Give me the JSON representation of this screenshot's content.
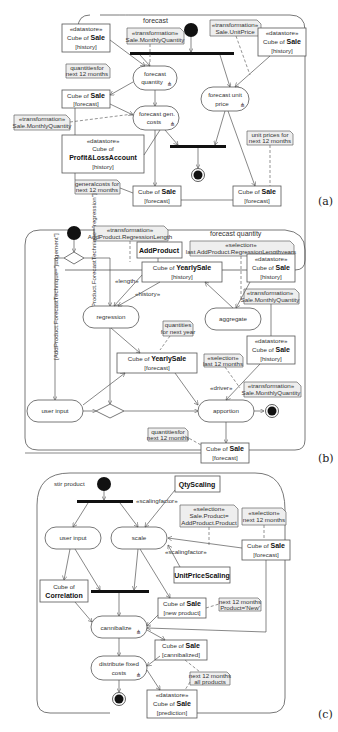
{
  "panels": [
    {
      "label": "(a)",
      "title": "forecast",
      "actions": [
        {
          "id": "forecast-quantity",
          "lines": [
            "forecast",
            "quantity"
          ],
          "rake": true
        },
        {
          "id": "forecast-unit-price",
          "lines": [
            "forecast unit",
            "price"
          ],
          "rake": true
        },
        {
          "id": "forecast-gen-costs",
          "lines": [
            "forecast gen.",
            "costs"
          ],
          "rake": true
        }
      ],
      "objects": [
        {
          "id": "sale-history-left",
          "stereotype": "«datastore»",
          "pre": "Cube of ",
          "bold": "Sale",
          "state": "[history]"
        },
        {
          "id": "sale-history-right",
          "stereotype": "«datastore»",
          "pre": "Cube of ",
          "bold": "Sale",
          "state": "[history]"
        },
        {
          "id": "sale-forecast-1",
          "pre": "Cube of ",
          "bold": "Sale",
          "state": "[forecast]"
        },
        {
          "id": "pl-history",
          "stereotype": "«datastore»",
          "pre": "Cube of",
          "bold": "Profit&LossAccount",
          "state": "[history]"
        },
        {
          "id": "sale-forecast-2",
          "pre": "Cube of ",
          "bold": "Sale",
          "state": "[forecast]"
        },
        {
          "id": "sale-forecast-3",
          "pre": "Cube of ",
          "bold": "Sale",
          "state": "[forecast]"
        }
      ],
      "notes": [
        {
          "id": "tr-monthly-qty-top",
          "lines": [
            "«transformation»",
            "Sale.MonthlyQuantity"
          ]
        },
        {
          "id": "tr-unit-price",
          "lines": [
            "«transformation»",
            "Sale.UnitPrice"
          ]
        },
        {
          "id": "qty-next12",
          "lines": [
            "quantitiesfor",
            "next 12 months"
          ]
        },
        {
          "id": "tr-monthly-qty-mid",
          "lines": [
            "«transformation»",
            "Sale.MonthlyQuantity"
          ]
        },
        {
          "id": "unit-prices-next12",
          "lines": [
            "unit prices for",
            "next 12 months"
          ]
        },
        {
          "id": "general-costs",
          "lines": [
            "generalcosts for",
            "next 12 months"
          ]
        }
      ]
    },
    {
      "label": "(b)",
      "title": "forecast quantity",
      "actions": [
        {
          "id": "regression",
          "lines": [
            "regression"
          ]
        },
        {
          "id": "aggregate",
          "lines": [
            "aggregate"
          ]
        },
        {
          "id": "user-input",
          "lines": [
            "user input"
          ]
        },
        {
          "id": "apportion",
          "lines": [
            "apportion"
          ]
        }
      ],
      "objects": [
        {
          "id": "addproduct",
          "bold": "AddProduct"
        },
        {
          "id": "yearlysale-history",
          "pre": "Cube of ",
          "bold": "YearlySale",
          "state": "[history]"
        },
        {
          "id": "sale-history-b1",
          "stereotype": "«datastore»",
          "pre": "Cube of ",
          "bold": "Sale",
          "state": "[history]"
        },
        {
          "id": "yearlysale-forecast",
          "pre": "Cube of ",
          "bold": "YearlySale",
          "state": "[forecast]"
        },
        {
          "id": "sale-history-b2",
          "stereotype": "«datastore»",
          "pre": "Cube of ",
          "bold": "Sale",
          "state": "[history]"
        },
        {
          "id": "sale-forecast-b",
          "pre": "Cube of ",
          "bold": "Sale",
          "state": "[forecast]"
        }
      ],
      "notes": [
        {
          "id": "tr-regression-length",
          "lines": [
            "«transformation»",
            "AddProduct.RegressionLength"
          ]
        },
        {
          "id": "sel-last-regression",
          "lines": [
            "«selection»",
            "last AddProduct.RegressionLengthyears"
          ]
        },
        {
          "id": "tr-monthly-qty-b1",
          "lines": [
            "«transformation»",
            "Sale.MonthlyQuantity"
          ]
        },
        {
          "id": "qty-next-year",
          "lines": [
            "quantities",
            "for next year"
          ]
        },
        {
          "id": "sel-last12",
          "lines": [
            "«selection»",
            "last 12 months"
          ]
        },
        {
          "id": "tr-monthly-qty-b2",
          "lines": [
            "«transformation»",
            "Sale.MonthlyQuantity"
          ]
        },
        {
          "id": "qty-next12-b",
          "lines": [
            "quantitiesfor",
            "next 12 months"
          ]
        }
      ],
      "edge_labels": {
        "guard_judgement": "[AddProduct.ForecastTechnique=\"judgement\"]",
        "guard_regression": "[AddProduct.ForecastTechnique=\"regression\"]",
        "length": "«length»",
        "history": "«history»",
        "driver": "«driver»"
      }
    },
    {
      "label": "(c)",
      "title": "stir product",
      "actions": [
        {
          "id": "user-input-c",
          "lines": [
            "user input"
          ]
        },
        {
          "id": "scale",
          "lines": [
            "scale"
          ]
        },
        {
          "id": "cannibalize",
          "lines": [
            "cannibalize"
          ],
          "rake": true
        },
        {
          "id": "distribute-fixed-costs",
          "lines": [
            "distribute fixed",
            "costs"
          ],
          "rake": true
        }
      ],
      "objects": [
        {
          "id": "qtyscaling",
          "bold": "QtyScaling"
        },
        {
          "id": "sale-forecast-c",
          "pre": "Cube of ",
          "bold": "Sale",
          "state": "[forecast]"
        },
        {
          "id": "unitpricescaling",
          "bold": "UnitPriceScaling"
        },
        {
          "id": "correlation",
          "pre": "Cube of",
          "bold": "Correlation"
        },
        {
          "id": "sale-new-product",
          "pre": "Cube of ",
          "bold": "Sale",
          "state": "[new product]"
        },
        {
          "id": "sale-cannibalized",
          "pre": "Cube of ",
          "bold": "Sale",
          "state": "[cannibalized]"
        },
        {
          "id": "sale-prediction",
          "stereotype": "«datastore»",
          "pre": "Cube of ",
          "bold": "Sale",
          "state": "[prediction]"
        }
      ],
      "notes": [
        {
          "id": "sel-product",
          "lines": [
            "«selection»",
            "Sale.Product=",
            "AddProduct.Product"
          ]
        },
        {
          "id": "sel-next12",
          "lines": [
            "«selection»",
            "next 12 months"
          ]
        },
        {
          "id": "next12-new",
          "lines": [
            "next 12 months",
            "Product='New'"
          ]
        },
        {
          "id": "next12-all",
          "lines": [
            "next 12 months",
            "all products"
          ]
        }
      ],
      "edge_labels": {
        "scalingfactor_top": "«scalingfactor»",
        "scalingfactor_mid": "«scalingfactor»"
      }
    }
  ]
}
